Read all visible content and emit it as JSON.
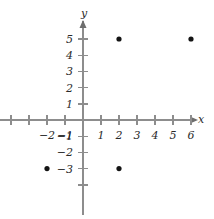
{
  "chart_data": {
    "type": "scatter",
    "title": "",
    "xlabel": "x",
    "ylabel": "y",
    "grid": false,
    "legend": null,
    "xlim": [
      -4.6,
      6.9
    ],
    "ylim": [
      -5.9,
      6.5
    ],
    "points": [
      {
        "x": 2,
        "y": 5
      },
      {
        "x": 6,
        "y": 5
      },
      {
        "x": -2,
        "y": -3
      },
      {
        "x": 2,
        "y": -3
      }
    ],
    "x_ticks": [
      -4,
      -3,
      -2,
      -1,
      1,
      2,
      3,
      4,
      5,
      6
    ],
    "x_tick_labels": [
      "",
      "",
      "−2",
      "−1",
      "1",
      "2",
      "3",
      "4",
      "5",
      "6"
    ],
    "y_ticks": [
      -4,
      -3,
      -2,
      -1,
      1,
      2,
      3,
      4,
      5
    ],
    "y_tick_labels": [
      "",
      "−3",
      "−2",
      "−1",
      "1",
      "2",
      "3",
      "4",
      "5"
    ],
    "axis_color": "#8d8d8d",
    "point_color": "#141414",
    "label_color": "#2a2a2a",
    "background_color": "#ffffff"
  },
  "axis_labels": {
    "x_axis_name": "x",
    "y_axis_name": "y"
  }
}
